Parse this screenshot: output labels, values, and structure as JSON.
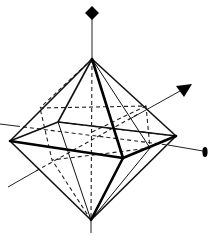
{
  "diagram": {
    "title": "",
    "colors": {
      "line": "#111111",
      "background": "#ffffff"
    },
    "vertices": {
      "top": [
        92,
        59
      ],
      "bottom": [
        91,
        220
      ],
      "left": [
        10,
        141
      ],
      "back": [
        58,
        122
      ],
      "right": [
        176,
        136
      ],
      "front": [
        123,
        158
      ]
    },
    "inner_hidden_vertices": {
      "a": [
        40,
        106
      ],
      "b": [
        146,
        104
      ],
      "c": [
        150,
        148
      ],
      "d": [
        52,
        160
      ]
    },
    "axes": [
      {
        "name": "vertical-axis",
        "from": [
          92,
          13
        ],
        "to": [
          91,
          232
        ],
        "arrowhead": "diamond"
      },
      {
        "name": "diagonal-axis",
        "from": [
          8,
          187
        ],
        "to": [
          185,
          88
        ],
        "arrowhead": "triangle"
      },
      {
        "name": "horizontal-axis",
        "from": [
          0,
          124
        ],
        "to": [
          205,
          152
        ],
        "arrowhead": "ellipse"
      }
    ]
  }
}
